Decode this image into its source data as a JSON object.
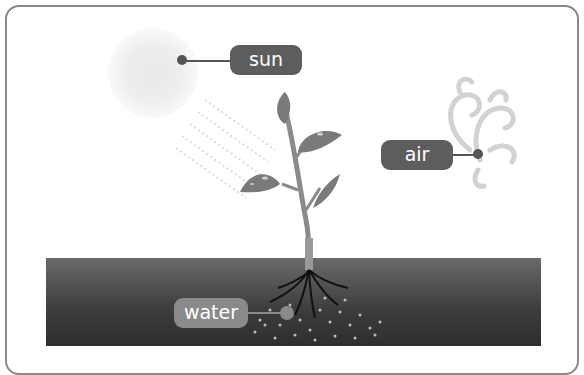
{
  "diagram": {
    "labels": {
      "sun": "sun",
      "air": "air",
      "water": "water"
    },
    "colors": {
      "label_bg": "#5d5d5d",
      "water_label_bg": "#8a8a8a",
      "soil_top": "#6a6a6a",
      "soil_bottom": "#2e2e2e",
      "plant": "#7a7a7a",
      "frame_border": "#8a8a8a"
    },
    "elements": [
      "sun",
      "sun-rays",
      "plant",
      "leaves",
      "air-swirls",
      "soil",
      "roots",
      "water-droplets"
    ]
  }
}
